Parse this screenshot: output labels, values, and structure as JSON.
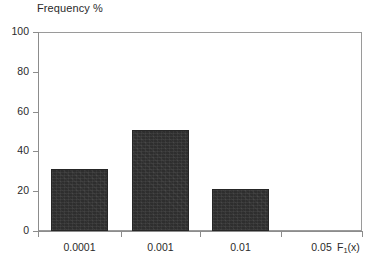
{
  "chart_data": {
    "type": "bar",
    "title": "",
    "xlabel": "F1(x)",
    "ylabel": "Frequency %",
    "categories": [
      "0.0001",
      "0.001",
      "0.01",
      "0.05"
    ],
    "values": [
      31,
      51,
      21,
      0
    ],
    "ylim": [
      0,
      100
    ],
    "yticks": [
      0,
      20,
      40,
      60,
      80,
      100
    ],
    "ytick_labels": [
      "0",
      "20",
      "40",
      "60",
      "80",
      "100"
    ],
    "xtick_labels": [
      "0.0001",
      "0.001",
      "0.01",
      "0.05"
    ],
    "grid": false,
    "legend": null,
    "bar_color": "#2e2e2e",
    "axis_color": "#8c8c8c",
    "background": "#ffffff"
  },
  "axes": {
    "y_title": "Frequency %",
    "x_title_base": "F",
    "x_title_sub": "1",
    "x_title_tail": "(x)"
  }
}
